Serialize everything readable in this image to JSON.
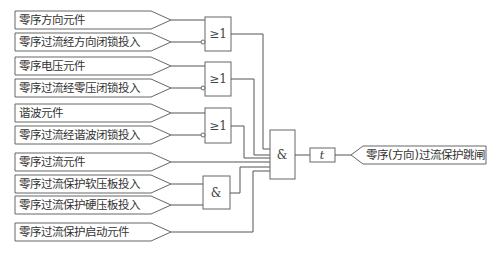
{
  "diagram": {
    "type": "logic-diagram",
    "inputs": [
      {
        "label": "零序方向元件",
        "gate": "or1",
        "inverted": false
      },
      {
        "label": "零序过流经方向闭锁投入",
        "gate": "or1",
        "inverted": true
      },
      {
        "label": "零序电压元件",
        "gate": "or2",
        "inverted": false
      },
      {
        "label": "零序过流经零压闭锁投入",
        "gate": "or2",
        "inverted": true
      },
      {
        "label": "谐波元件",
        "gate": "or3",
        "inverted": false
      },
      {
        "label": "零序过流经谐波闭锁投入",
        "gate": "or3",
        "inverted": true
      },
      {
        "label": "零序过流元件",
        "gate": "and_main",
        "inverted": false
      },
      {
        "label": "零序过流保护软压板投入",
        "gate": "and1",
        "inverted": false
      },
      {
        "label": "零序过流保护硬压板投入",
        "gate": "and1",
        "inverted": false
      },
      {
        "label": "零序过流保护启动元件",
        "gate": "and_main",
        "inverted": false
      }
    ],
    "gates": {
      "or1": {
        "symbol": "≥1"
      },
      "or2": {
        "symbol": "≥1"
      },
      "or3": {
        "symbol": "≥1"
      },
      "and1": {
        "symbol": "&"
      },
      "and_main": {
        "symbol": "&"
      }
    },
    "timer": {
      "symbol": "t"
    },
    "output": {
      "label": "零序(方向)过流保护跳闸"
    }
  }
}
